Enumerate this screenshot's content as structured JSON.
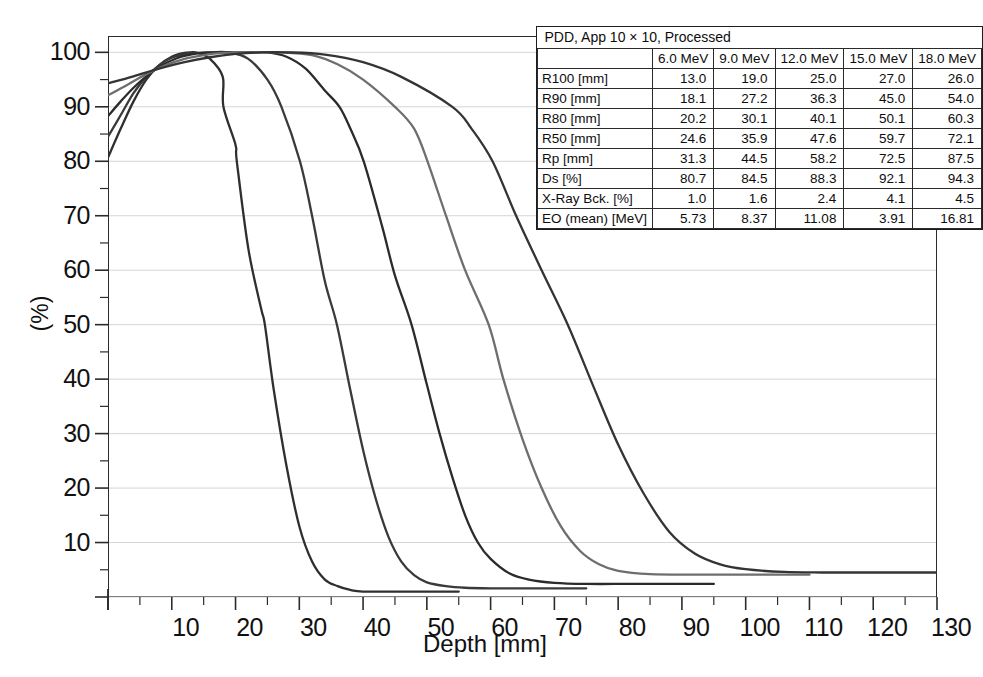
{
  "chart_data": {
    "type": "line",
    "title": "",
    "xlabel": "Depth [mm]",
    "ylabel": "(%)",
    "xlim": [
      0,
      130
    ],
    "ylim": [
      0,
      103
    ],
    "xticks": [
      10,
      20,
      30,
      40,
      50,
      60,
      70,
      80,
      90,
      100,
      110,
      120,
      130
    ],
    "yticks": [
      10,
      20,
      30,
      40,
      50,
      60,
      70,
      80,
      90,
      100
    ],
    "x_minor_step": 5,
    "y_minor_step": 5,
    "grid": "horizontal-major-only",
    "legend": "none (values tabulated in table)",
    "series": [
      {
        "name": "6.0 MeV",
        "color": "#2f2f2f",
        "surface_dose_pct": 80.7,
        "points": [
          [
            0,
            80.7
          ],
          [
            2,
            86.0
          ],
          [
            4,
            91.0
          ],
          [
            6,
            95.0
          ],
          [
            8,
            97.6
          ],
          [
            10,
            99.2
          ],
          [
            12,
            99.9
          ],
          [
            13,
            100.0
          ],
          [
            14,
            99.9
          ],
          [
            16,
            98.8
          ],
          [
            18,
            95.5
          ],
          [
            18.1,
            90.0
          ],
          [
            20,
            83.0
          ],
          [
            20.2,
            80.0
          ],
          [
            22,
            64.0
          ],
          [
            24,
            53.0
          ],
          [
            24.6,
            50.0
          ],
          [
            26,
            38.0
          ],
          [
            28,
            24.0
          ],
          [
            30,
            13.0
          ],
          [
            32,
            6.5
          ],
          [
            34,
            3.2
          ],
          [
            36,
            2.0
          ],
          [
            38,
            1.3
          ],
          [
            40,
            1.0
          ],
          [
            45,
            1.0
          ],
          [
            50,
            1.0
          ],
          [
            55,
            1.0
          ]
        ],
        "x_end": 55
      },
      {
        "name": "9.0 MeV",
        "color": "#3a3a3a",
        "surface_dose_pct": 84.5,
        "points": [
          [
            0,
            84.5
          ],
          [
            2,
            88.5
          ],
          [
            4,
            92.5
          ],
          [
            6,
            95.5
          ],
          [
            8,
            97.6
          ],
          [
            10,
            99.0
          ],
          [
            13,
            99.8
          ],
          [
            16,
            100.0
          ],
          [
            19,
            100.0
          ],
          [
            22,
            98.8
          ],
          [
            25,
            95.0
          ],
          [
            27.2,
            90.0
          ],
          [
            30.1,
            80.0
          ],
          [
            32,
            70.0
          ],
          [
            34,
            58.0
          ],
          [
            35.9,
            50.0
          ],
          [
            38,
            38.0
          ],
          [
            40,
            27.0
          ],
          [
            42,
            18.0
          ],
          [
            44,
            11.0
          ],
          [
            46,
            6.5
          ],
          [
            48,
            4.0
          ],
          [
            50,
            2.7
          ],
          [
            53,
            2.0
          ],
          [
            56,
            1.7
          ],
          [
            60,
            1.6
          ],
          [
            65,
            1.6
          ],
          [
            70,
            1.6
          ],
          [
            75,
            1.6
          ]
        ],
        "x_end": 75
      },
      {
        "name": "12.0 MeV",
        "color": "#2b2b2b",
        "surface_dose_pct": 88.3,
        "points": [
          [
            0,
            88.3
          ],
          [
            2,
            91.0
          ],
          [
            4,
            93.5
          ],
          [
            6,
            95.6
          ],
          [
            8,
            97.3
          ],
          [
            11,
            99.0
          ],
          [
            14,
            99.8
          ],
          [
            17,
            100.0
          ],
          [
            21,
            100.0
          ],
          [
            25,
            100.0
          ],
          [
            28,
            99.2
          ],
          [
            31,
            97.0
          ],
          [
            34,
            93.0
          ],
          [
            36.3,
            90.0
          ],
          [
            38,
            86.0
          ],
          [
            40.1,
            80.0
          ],
          [
            43,
            68.0
          ],
          [
            45,
            59.0
          ],
          [
            47.6,
            50.0
          ],
          [
            50,
            39.0
          ],
          [
            52,
            30.0
          ],
          [
            54,
            22.0
          ],
          [
            56,
            15.0
          ],
          [
            58,
            10.0
          ],
          [
            60,
            7.0
          ],
          [
            63,
            4.3
          ],
          [
            66,
            3.2
          ],
          [
            70,
            2.6
          ],
          [
            75,
            2.4
          ],
          [
            82,
            2.4
          ],
          [
            90,
            2.4
          ],
          [
            95,
            2.4
          ]
        ],
        "x_end": 95
      },
      {
        "name": "15.0 MeV",
        "color": "#6e6e6e",
        "surface_dose_pct": 92.1,
        "points": [
          [
            0,
            92.1
          ],
          [
            3,
            94.0
          ],
          [
            6,
            96.0
          ],
          [
            9,
            97.6
          ],
          [
            12,
            98.8
          ],
          [
            15,
            99.5
          ],
          [
            18,
            99.9
          ],
          [
            22,
            100.0
          ],
          [
            27,
            100.0
          ],
          [
            32,
            99.5
          ],
          [
            36,
            97.8
          ],
          [
            40,
            95.0
          ],
          [
            45,
            90.0
          ],
          [
            48,
            86.0
          ],
          [
            50.1,
            80.0
          ],
          [
            53,
            70.0
          ],
          [
            56,
            60.0
          ],
          [
            59.7,
            50.0
          ],
          [
            62,
            40.0
          ],
          [
            65,
            29.0
          ],
          [
            68,
            20.0
          ],
          [
            71,
            13.0
          ],
          [
            74,
            8.5
          ],
          [
            77,
            6.0
          ],
          [
            80,
            4.8
          ],
          [
            85,
            4.2
          ],
          [
            92,
            4.1
          ],
          [
            100,
            4.1
          ],
          [
            110,
            4.1
          ]
        ],
        "x_end": 110
      },
      {
        "name": "18.0 MeV",
        "color": "#343434",
        "surface_dose_pct": 94.3,
        "points": [
          [
            0,
            94.3
          ],
          [
            4,
            95.6
          ],
          [
            8,
            97.0
          ],
          [
            12,
            98.2
          ],
          [
            16,
            99.1
          ],
          [
            20,
            99.7
          ],
          [
            24,
            100.0
          ],
          [
            28,
            100.0
          ],
          [
            34,
            99.6
          ],
          [
            40,
            98.2
          ],
          [
            46,
            95.5
          ],
          [
            54,
            90.0
          ],
          [
            57,
            86.0
          ],
          [
            60.3,
            80.0
          ],
          [
            64,
            70.0
          ],
          [
            68,
            60.0
          ],
          [
            72.1,
            50.0
          ],
          [
            76,
            39.0
          ],
          [
            80,
            28.0
          ],
          [
            84,
            19.0
          ],
          [
            88,
            12.0
          ],
          [
            92,
            8.0
          ],
          [
            96,
            6.0
          ],
          [
            100,
            5.1
          ],
          [
            106,
            4.6
          ],
          [
            112,
            4.5
          ],
          [
            120,
            4.5
          ],
          [
            130,
            4.5
          ]
        ],
        "x_end": 130
      }
    ]
  },
  "table": {
    "caption": "PDD, App 10 × 10, Processed",
    "columns": [
      "",
      "6.0 MeV",
      "9.0 MeV",
      "12.0 MeV",
      "15.0 MeV",
      "18.0 MeV"
    ],
    "rows": [
      {
        "label": "R100 [mm]",
        "values": [
          "13.0",
          "19.0",
          "25.0",
          "27.0",
          "26.0"
        ]
      },
      {
        "label": "R90 [mm]",
        "values": [
          "18.1",
          "27.2",
          "36.3",
          "45.0",
          "54.0"
        ]
      },
      {
        "label": "R80 [mm]",
        "values": [
          "20.2",
          "30.1",
          "40.1",
          "50.1",
          "60.3"
        ]
      },
      {
        "label": "R50 [mm]",
        "values": [
          "24.6",
          "35.9",
          "47.6",
          "59.7",
          "72.1"
        ]
      },
      {
        "label": "Rp [mm]",
        "values": [
          "31.3",
          "44.5",
          "58.2",
          "72.5",
          "87.5"
        ]
      },
      {
        "label": "Ds [%]",
        "values": [
          "80.7",
          "84.5",
          "88.3",
          "92.1",
          "94.3"
        ]
      },
      {
        "label": "X-Ray Bck. [%]",
        "values": [
          "1.0",
          "1.6",
          "2.4",
          "4.1",
          "4.5"
        ]
      },
      {
        "label": "EO (mean) [MeV]",
        "values": [
          "5.73",
          "8.37",
          "11.08",
          "3.91",
          "16.81"
        ]
      }
    ]
  },
  "axes": {
    "y_tick_labels": [
      "100",
      "90",
      "80",
      "70",
      "60",
      "50",
      "40",
      "30",
      "20",
      "10"
    ],
    "x_tick_labels": [
      "10",
      "20",
      "30",
      "40",
      "50",
      "60",
      "70",
      "80",
      "90",
      "100",
      "110",
      "120",
      "130"
    ],
    "x_title": "Depth [mm]",
    "y_title": "(%)"
  },
  "colors": {
    "frame": "#2b2b2b",
    "grid": "#d5d5d5",
    "background": "#ffffff",
    "text": "#111111"
  }
}
